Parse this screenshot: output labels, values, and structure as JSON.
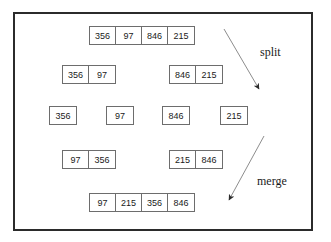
{
  "diagram": {
    "border_color": "#2b2b2b",
    "box_border_color": "#6d6d6d",
    "text_color": "#1a1a1a",
    "background": "#ffffff",
    "rows": [
      {
        "id": "row-unsorted",
        "groups": [
          {
            "id": "group-full-unsorted",
            "values": [
              "356",
              "97",
              "846",
              "215"
            ]
          }
        ]
      },
      {
        "id": "row-split-halves",
        "groups": [
          {
            "id": "group-left-half",
            "values": [
              "356",
              "97"
            ]
          },
          {
            "id": "group-right-half",
            "values": [
              "846",
              "215"
            ]
          }
        ]
      },
      {
        "id": "row-singletons",
        "groups": [
          {
            "id": "group-single-356",
            "values": [
              "356"
            ]
          },
          {
            "id": "group-single-97",
            "values": [
              "97"
            ]
          },
          {
            "id": "group-single-846",
            "values": [
              "846"
            ]
          },
          {
            "id": "group-single-215",
            "values": [
              "215"
            ]
          }
        ]
      },
      {
        "id": "row-merged-pairs",
        "groups": [
          {
            "id": "group-left-sorted-pair",
            "values": [
              "97",
              "356"
            ]
          },
          {
            "id": "group-right-sorted-pair",
            "values": [
              "215",
              "846"
            ]
          }
        ]
      },
      {
        "id": "row-sorted",
        "groups": [
          {
            "id": "group-full-sorted",
            "values": [
              "97",
              "215",
              "356",
              "846"
            ]
          }
        ]
      }
    ],
    "annotations": [
      {
        "id": "split-label",
        "text": "split"
      },
      {
        "id": "merge-label",
        "text": "merge"
      }
    ],
    "arrows": [
      {
        "id": "split-arrow",
        "direction": "down-right"
      },
      {
        "id": "merge-arrow",
        "direction": "down-left"
      }
    ]
  }
}
